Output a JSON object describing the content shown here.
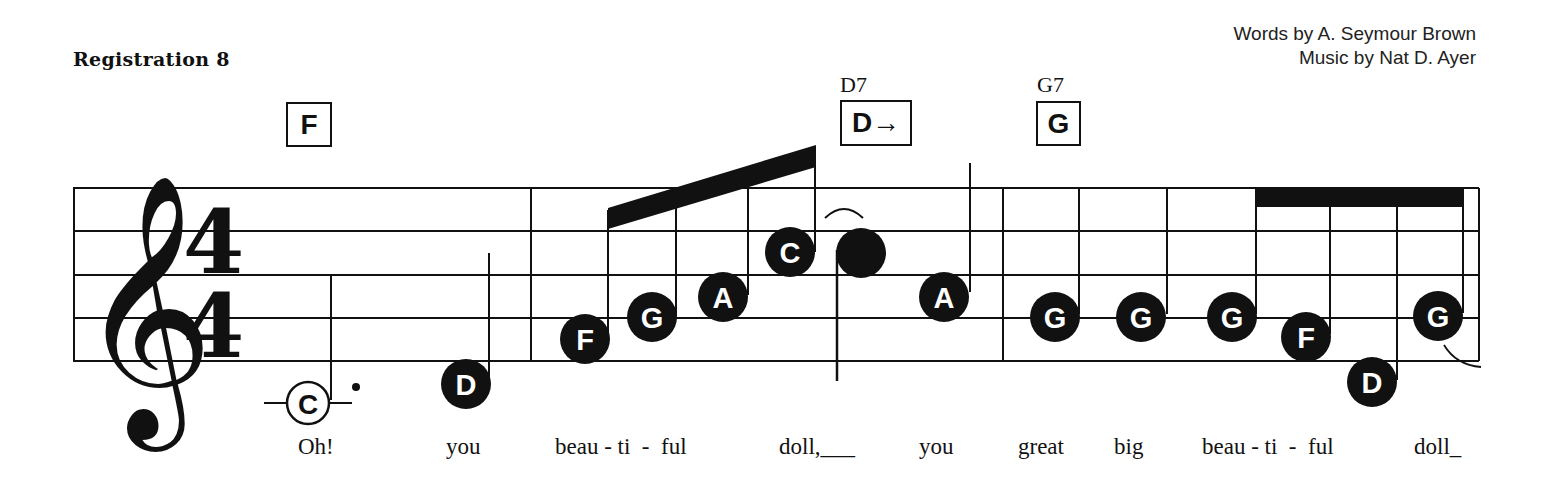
{
  "header": {
    "registration": "Registration 8",
    "words_credit": "Words by A. Seymour Brown",
    "music_credit": "Music by Nat  D. Ayer"
  },
  "chords": [
    {
      "name": "",
      "box": "F"
    },
    {
      "name": "D7",
      "box": "D→"
    },
    {
      "name": "G7",
      "box": "G"
    }
  ],
  "staff": {
    "clef": "treble-clef",
    "time_signature": {
      "top": "4",
      "bottom": "4"
    },
    "measures": [
      {
        "notes": [
          {
            "letter": "C",
            "duration": "dotted-half",
            "style": "open"
          },
          {
            "letter": "D",
            "duration": "quarter",
            "style": "filled"
          }
        ]
      },
      {
        "notes": [
          {
            "letter": "F",
            "duration": "eighth"
          },
          {
            "letter": "G",
            "duration": "eighth"
          },
          {
            "letter": "A",
            "duration": "eighth"
          },
          {
            "letter": "C",
            "duration": "eighth"
          },
          {
            "letter": "",
            "duration": "quarter",
            "style": "plain"
          },
          {
            "letter": "A",
            "duration": "quarter"
          }
        ]
      },
      {
        "notes": [
          {
            "letter": "G",
            "duration": "quarter"
          },
          {
            "letter": "G",
            "duration": "quarter"
          },
          {
            "letter": "G",
            "duration": "eighth"
          },
          {
            "letter": "F",
            "duration": "eighth"
          },
          {
            "letter": "D",
            "duration": "eighth"
          },
          {
            "letter": "G",
            "duration": "eighth"
          }
        ]
      }
    ]
  },
  "lyrics": [
    "Oh!",
    "you",
    "beau - ti  -  ful",
    "doll,___",
    "you",
    "great",
    "big",
    "beau - ti  -  ful",
    "doll_"
  ]
}
